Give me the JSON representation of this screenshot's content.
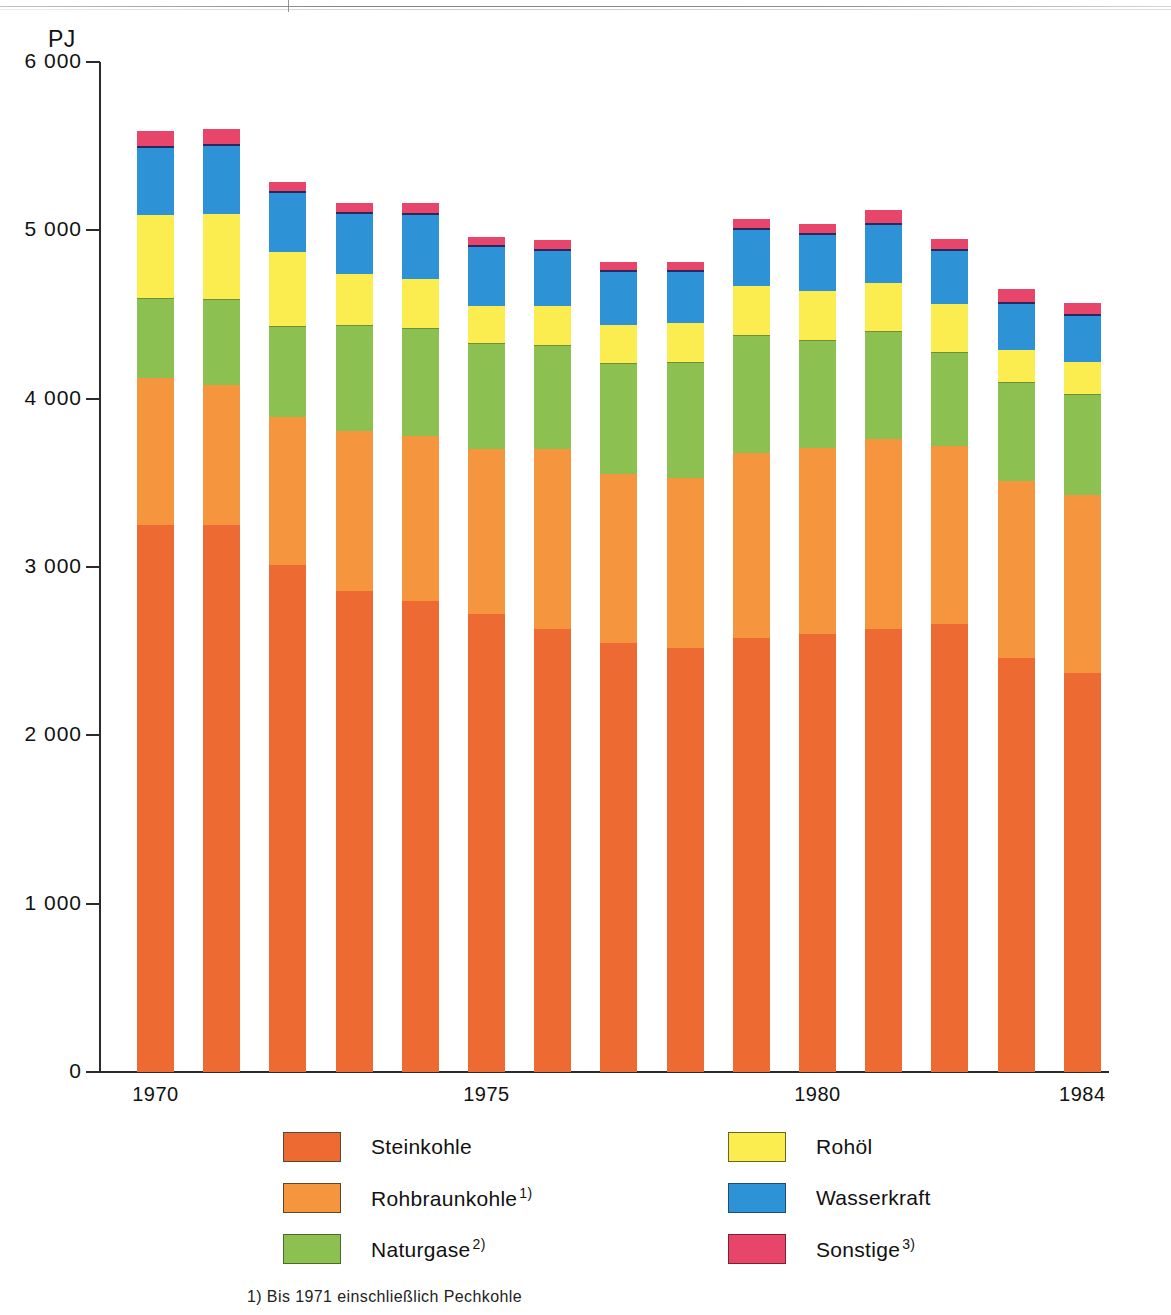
{
  "figure": {
    "unit_label": "PJ",
    "footnotes": [
      "1) Bis 1971 einschließlich Pechkohle"
    ]
  },
  "axes": {
    "y_ticks": [
      "6 000",
      "5 000",
      "4 000",
      "3 000",
      "2 000",
      "1 000",
      "0"
    ],
    "y_tick_values": [
      6000,
      5000,
      4000,
      3000,
      2000,
      1000,
      0
    ],
    "x_tick_labels": [
      "1970",
      "1975",
      "1980",
      "1984"
    ],
    "x_tick_years": [
      1970,
      1975,
      1980,
      1984
    ]
  },
  "legend": {
    "position": "below-plot",
    "columns": [
      {
        "items": [
          {
            "label": "Steinkohle",
            "sup": "",
            "color": "#ee6a33",
            "key": "steinkohle"
          },
          {
            "label": "Rohbraunkohle",
            "sup": "1)",
            "color": "#f5963f",
            "key": "rohbraunkohle"
          },
          {
            "label": "Naturgase",
            "sup": "2)",
            "color": "#8cc152",
            "key": "naturgase"
          }
        ]
      },
      {
        "items": [
          {
            "label": "Rohöl",
            "sup": "",
            "color": "#fbec4f",
            "key": "rohoel"
          },
          {
            "label": "Wasserkraft",
            "sup": "",
            "color": "#2d92d6",
            "key": "wasserkraft"
          },
          {
            "label": "Sonstige",
            "sup": "3)",
            "color": "#e8456b",
            "key": "sonstige"
          }
        ]
      }
    ]
  },
  "chart_data": {
    "type": "bar",
    "stacked": true,
    "title": "",
    "subtitle": "",
    "xlabel": "",
    "ylabel": "PJ",
    "ylim": [
      0,
      6000
    ],
    "ytick_step": 1000,
    "grid": false,
    "legend_position": "bottom",
    "categories": [
      "1970",
      "1971",
      "1972",
      "1973",
      "1974",
      "1975",
      "1976",
      "1977",
      "1978",
      "1979",
      "1980",
      "1981",
      "1982",
      "1983",
      "1984"
    ],
    "series": [
      {
        "name": "Steinkohle",
        "color": "#ee6a33",
        "values": [
          3250,
          3250,
          3010,
          2860,
          2800,
          2720,
          2630,
          2550,
          2520,
          2580,
          2600,
          2630,
          2660,
          2460,
          2370
        ]
      },
      {
        "name": "Rohbraunkohle",
        "color": "#f5963f",
        "values": [
          870,
          830,
          880,
          950,
          980,
          980,
          1070,
          1000,
          1010,
          1100,
          1110,
          1130,
          1060,
          1050,
          1060
        ]
      },
      {
        "name": "Naturgase",
        "color": "#8cc152",
        "values": [
          480,
          510,
          540,
          630,
          640,
          630,
          620,
          660,
          690,
          700,
          640,
          640,
          560,
          590,
          600
        ]
      },
      {
        "name": "Rohöl",
        "color": "#fbec4f",
        "values": [
          490,
          510,
          440,
          300,
          290,
          220,
          230,
          230,
          230,
          290,
          290,
          290,
          280,
          190,
          190
        ]
      },
      {
        "name": "Wasserkraft",
        "color": "#2d92d6",
        "values": [
          400,
          400,
          350,
          360,
          380,
          350,
          330,
          310,
          300,
          330,
          330,
          340,
          320,
          270,
          270
        ]
      },
      {
        "name": "Sonstige",
        "color": "#e8456b",
        "values": [
          100,
          100,
          70,
          60,
          70,
          60,
          60,
          60,
          60,
          70,
          70,
          90,
          70,
          90,
          80
        ]
      }
    ],
    "totals": [
      5590,
      5600,
      5290,
      5160,
      5160,
      4960,
      4940,
      4810,
      4810,
      5070,
      5040,
      5120,
      4950,
      4650,
      4570
    ]
  }
}
